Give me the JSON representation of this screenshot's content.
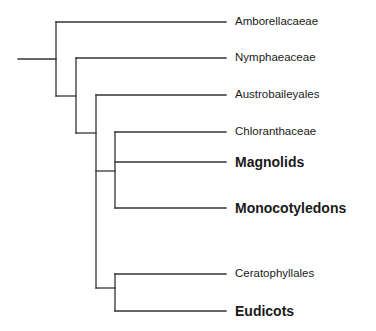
{
  "diagram": {
    "type": "phylogenetic-tree",
    "line_color": "#333333",
    "taxa": [
      {
        "label": "Amborellacaeae",
        "emphasis": "normal",
        "y": 22
      },
      {
        "label": "Nymphaeaceae",
        "emphasis": "normal",
        "y": 58
      },
      {
        "label": "Austrobaileyales",
        "emphasis": "normal",
        "y": 95
      },
      {
        "label": "Chloranthaceae",
        "emphasis": "normal",
        "y": 132
      },
      {
        "label": "Magnolids",
        "emphasis": "bold",
        "y": 162
      },
      {
        "label": "Monocotyledons",
        "emphasis": "bold",
        "y": 208
      },
      {
        "label": "Ceratophyllales",
        "emphasis": "normal",
        "y": 274
      },
      {
        "label": "Eudicots",
        "emphasis": "bold",
        "y": 311
      }
    ]
  }
}
